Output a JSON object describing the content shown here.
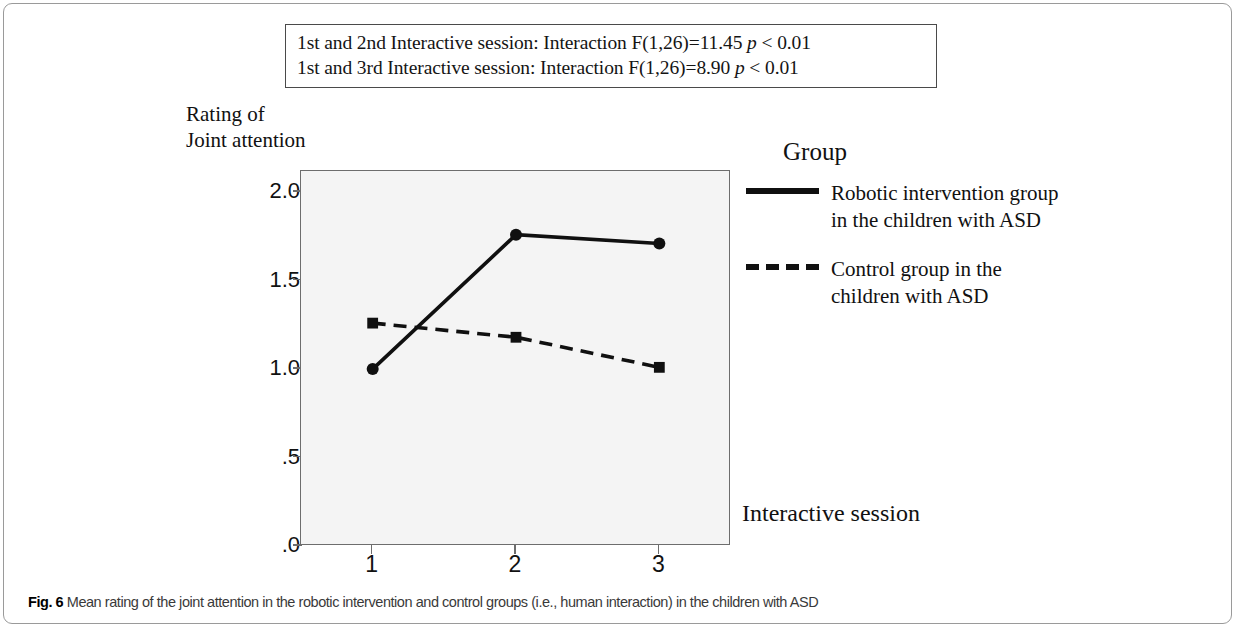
{
  "annotation_box": {
    "line1_prefix": "1st and 2nd Interactive session: Interaction F(1,26)=11.45 ",
    "line1_p": "p",
    "line1_suffix": " < 0.01",
    "line2_prefix": "1st and 3rd Interactive session: Interaction F(1,26)=8.90 ",
    "line2_p": "p",
    "line2_suffix": " < 0.01"
  },
  "axis": {
    "y_title_line1": "Rating of",
    "y_title_line2": "Joint attention",
    "x_title": "Interactive session"
  },
  "legend": {
    "title": "Group",
    "items": [
      {
        "style": "solid",
        "line1": "Robotic intervention group",
        "line2": "in the children with ASD"
      },
      {
        "style": "dashed",
        "line1": "Control group in the",
        "line2": "children with ASD"
      }
    ]
  },
  "caption": {
    "label": "Fig. 6",
    "text": "Mean rating of the joint attention in the robotic intervention and control groups (i.e., human interaction) in the children with ASD"
  },
  "colors": {
    "line": "#101010",
    "plot_background": "#f4f4f4",
    "frame": "#6d6d6d",
    "figure_border": "#9a9a9a"
  },
  "chart_data": {
    "type": "line",
    "title": "",
    "xlabel": "Interactive session",
    "ylabel": "Rating of Joint attention",
    "x": [
      1,
      2,
      3
    ],
    "xtick_labels": [
      "1",
      "2",
      "3"
    ],
    "ytick_labels": [
      ".0",
      ".5",
      "1.0",
      "1.5",
      "2.0"
    ],
    "ytick_values": [
      0,
      0.5,
      1.0,
      1.5,
      2.0
    ],
    "ylim": [
      0,
      2.12
    ],
    "xlim": [
      0.5,
      3.5
    ],
    "grid": false,
    "legend_position": "right",
    "series": [
      {
        "name": "Robotic intervention group in the children with ASD",
        "style": "solid",
        "marker": "circle",
        "values": [
          1.0,
          1.76,
          1.71
        ]
      },
      {
        "name": "Control group in the children with ASD",
        "style": "dashed",
        "marker": "square",
        "values": [
          1.26,
          1.18,
          1.01
        ]
      }
    ]
  }
}
